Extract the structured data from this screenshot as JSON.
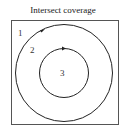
{
  "title": "Intersect coverage",
  "regions": [
    {
      "id": "1",
      "label": "1",
      "x": 20,
      "y": 35
    },
    {
      "id": "2",
      "label": "2",
      "x": 32,
      "y": 53
    },
    {
      "id": "3",
      "label": "3",
      "x": 61,
      "y": 76
    }
  ],
  "colors": {
    "stroke": "#222222",
    "frame": "#555555",
    "background": "#ffffff"
  }
}
